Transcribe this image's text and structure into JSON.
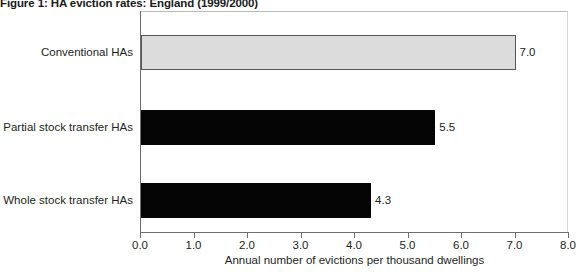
{
  "chart_data": {
    "type": "bar",
    "orientation": "horizontal",
    "title": "Figure 1: HA eviction rates: England (1999/2000)",
    "categories": [
      "Conventional HAs",
      "Partial stock transfer HAs",
      "Whole stock transfer HAs"
    ],
    "values": [
      7.0,
      5.5,
      4.3
    ],
    "value_labels": [
      "7.0",
      "5.5",
      "4.3"
    ],
    "bar_styles": [
      "light",
      "dark",
      "dark"
    ],
    "xlabel": "Annual number of evictions per thousand dwellings",
    "ylabel": "",
    "xlim": [
      0.0,
      8.0
    ],
    "xticks": [
      0.0,
      1.0,
      2.0,
      3.0,
      4.0,
      5.0,
      6.0,
      7.0,
      8.0
    ],
    "xtick_labels": [
      "0.0",
      "1.0",
      "2.0",
      "3.0",
      "4.0",
      "5.0",
      "6.0",
      "7.0",
      "8.0"
    ],
    "grid": false,
    "legend": false,
    "colors": {
      "bar_dark": "#050505",
      "bar_light_fill": "#dcdcdc",
      "bar_light_border": "#555555",
      "axis": "#6e6e6e",
      "text": "#231f20"
    }
  }
}
